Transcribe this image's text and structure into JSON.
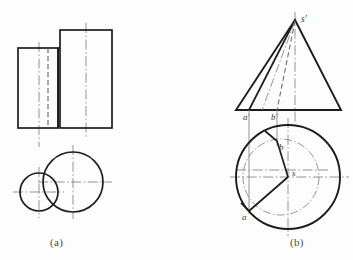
{
  "figure": {
    "type": "engineering-drawing",
    "captions": {
      "left": "(a)",
      "right": "(b)"
    },
    "colors": {
      "outline": "#1d1d1d",
      "hidden": "#6f6f6f",
      "centerline": "#7a7a7a",
      "thin": "#8a8a8a",
      "text": "#3b3b3b",
      "background": "#fdfdfd"
    },
    "part_a": {
      "label": "(a)",
      "front_view": {
        "large_rect": {
          "x": 60,
          "y": 30,
          "w": 52,
          "h": 98
        },
        "small_rect": {
          "x": 18,
          "y": 48,
          "w": 40,
          "h": 80
        }
      },
      "top_view": {
        "large_circle": {
          "cx": 73,
          "cy": 182,
          "r": 30
        },
        "small_circle": {
          "cx": 39,
          "cy": 192,
          "r": 19
        }
      }
    },
    "part_b": {
      "label": "(b)",
      "front_view": {
        "apex_label": "s'",
        "base_point_labels": [
          "a'",
          "b'"
        ],
        "apex": {
          "x": 295,
          "y": 20
        },
        "base_left": {
          "x": 236,
          "y": 110
        },
        "base_right": {
          "x": 341,
          "y": 110
        },
        "a_prime": {
          "x": 249,
          "y": 110
        },
        "b_prime": {
          "x": 277,
          "y": 110
        }
      },
      "top_view": {
        "center_label": "s",
        "point_labels": [
          "a",
          "b"
        ],
        "circle": {
          "cx": 288,
          "cy": 177,
          "r": 52
        },
        "inner_circle": {
          "cx": 281,
          "cy": 177,
          "r": 38
        },
        "point_a": {
          "x": 249,
          "y": 210
        },
        "point_b": {
          "x": 277,
          "y": 140
        },
        "center": {
          "x": 288,
          "y": 177
        }
      }
    }
  }
}
